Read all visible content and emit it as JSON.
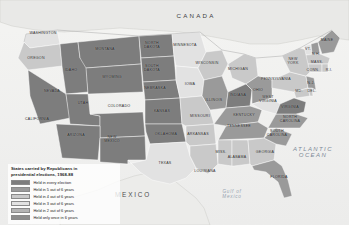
{
  "figure": {
    "width": 349,
    "height": 225,
    "background": "#ffffff"
  },
  "legend": {
    "title": "States carried by Republicans in\npresidential elections, 1968-88",
    "items": [
      {
        "label": "Held in every election",
        "color": "#7d7d7d",
        "count": 6
      },
      {
        "label": "Held in 5 out of 6 years",
        "color": "#9a9a9a",
        "count": 5
      },
      {
        "label": "Held in 4 out of 6 years",
        "color": "#c9c9c9",
        "count": 4
      },
      {
        "label": "Held in 3 out of 6 years",
        "color": "#e2e2e2",
        "count": 3
      },
      {
        "label": "Held in 2 out of 6 years",
        "color": "#b4b4b4",
        "count": 2
      },
      {
        "label": "Held only once in 6 years",
        "color": "#8c8c8c",
        "count": 1
      }
    ]
  },
  "geo_labels": [
    {
      "name": "CANADA",
      "x": 196,
      "y": 16,
      "class": "country-label"
    },
    {
      "name": "MEXICO",
      "x": 133,
      "y": 195,
      "class": "mexico-label"
    },
    {
      "name": "ATLANTIC\nOCEAN",
      "x": 313,
      "y": 152,
      "class": "ocean-label"
    },
    {
      "name": "Gulf of\nMexico",
      "x": 232,
      "y": 195,
      "class": "gulf-label"
    }
  ],
  "states": [
    {
      "name": "WASHINGTON",
      "x": 43,
      "y": 34,
      "tier": 4
    },
    {
      "name": "OREGON",
      "x": 36,
      "y": 59,
      "tier": 4
    },
    {
      "name": "MONTANA",
      "x": 105,
      "y": 50,
      "tier": 6
    },
    {
      "name": "IDAHO",
      "x": 71,
      "y": 71,
      "tier": 6
    },
    {
      "name": "WYOMING",
      "x": 112,
      "y": 78,
      "tier": 6
    },
    {
      "name": "NORTH\nDAKOTA",
      "x": 152,
      "y": 46,
      "tier": 6
    },
    {
      "name": "SOUTH\nDAKOTA",
      "x": 152,
      "y": 69,
      "tier": 6
    },
    {
      "name": "NEBRASKA",
      "x": 155,
      "y": 89,
      "tier": 6
    },
    {
      "name": "NEVADA",
      "x": 52,
      "y": 92,
      "tier": 6
    },
    {
      "name": "UTAH",
      "x": 83,
      "y": 104,
      "tier": 6
    },
    {
      "name": "COLORADO",
      "x": 119,
      "y": 107,
      "tier": 6
    },
    {
      "name": "KANSAS",
      "x": 162,
      "y": 112,
      "tier": 6
    },
    {
      "name": "CALIFORNIA",
      "x": 37,
      "y": 120,
      "tier": 6
    },
    {
      "name": "ARIZONA",
      "x": 76,
      "y": 136,
      "tier": 6
    },
    {
      "name": "NEW\nMEXICO",
      "x": 112,
      "y": 140,
      "tier": 6
    },
    {
      "name": "OKLAHOMA",
      "x": 166,
      "y": 135,
      "tier": 6
    },
    {
      "name": "TEXAS",
      "x": 165,
      "y": 164,
      "tier": 4
    },
    {
      "name": "MINNESOTA",
      "x": 185,
      "y": 46,
      "tier": 3
    },
    {
      "name": "IOWA",
      "x": 190,
      "y": 85,
      "tier": 3
    },
    {
      "name": "MISSOURI",
      "x": 200,
      "y": 117,
      "tier": 4
    },
    {
      "name": "ARKANSAS",
      "x": 198,
      "y": 135,
      "tier": 4
    },
    {
      "name": "LOUISIANA",
      "x": 205,
      "y": 172,
      "tier": 4
    },
    {
      "name": "WISCONSIN",
      "x": 207,
      "y": 64,
      "tier": 4
    },
    {
      "name": "ILLINOIS",
      "x": 214,
      "y": 101,
      "tier": 5
    },
    {
      "name": "MICHIGAN",
      "x": 238,
      "y": 70,
      "tier": 4
    },
    {
      "name": "INDIANA",
      "x": 238,
      "y": 96,
      "tier": 6
    },
    {
      "name": "OHIO",
      "x": 258,
      "y": 91,
      "tier": 5
    },
    {
      "name": "KENTUCKY",
      "x": 244,
      "y": 116,
      "tier": 5
    },
    {
      "name": "TENNESSEE",
      "x": 239,
      "y": 127,
      "tier": 5
    },
    {
      "name": "MISS.",
      "x": 221,
      "y": 153,
      "tier": 4
    },
    {
      "name": "ALABAMA",
      "x": 237,
      "y": 158,
      "tier": 4
    },
    {
      "name": "GEORGIA",
      "x": 265,
      "y": 153,
      "tier": 4
    },
    {
      "name": "FLORIDA",
      "x": 279,
      "y": 178,
      "tier": 5
    },
    {
      "name": "SOUTH\nCAROLINA",
      "x": 277,
      "y": 134,
      "tier": 5
    },
    {
      "name": "NORTH\nCAROLINA",
      "x": 290,
      "y": 120,
      "tier": 5
    },
    {
      "name": "VIRGINIA",
      "x": 290,
      "y": 108,
      "tier": 6
    },
    {
      "name": "WEST\nVIRGINIA",
      "x": 268,
      "y": 100,
      "tier": 3
    },
    {
      "name": "PENNSYLVANIA",
      "x": 276,
      "y": 80,
      "tier": 4
    },
    {
      "name": "NEW\nYORK",
      "x": 293,
      "y": 62,
      "tier": 4
    },
    {
      "name": "MAINE",
      "x": 327,
      "y": 41,
      "tier": 5
    },
    {
      "name": "VT.",
      "x": 308,
      "y": 50,
      "tier": 3
    },
    {
      "name": "N.H.",
      "x": 316,
      "y": 55,
      "tier": 5
    },
    {
      "name": "MASS.",
      "x": 317,
      "y": 63,
      "tier": 4
    },
    {
      "name": "CONN.",
      "x": 313,
      "y": 71,
      "tier": 4
    },
    {
      "name": "R.I.",
      "x": 329,
      "y": 71,
      "tier": 4
    },
    {
      "name": "N.J.",
      "x": 311,
      "y": 84,
      "tier": 5
    },
    {
      "name": "MD.",
      "x": 299,
      "y": 92,
      "tier": 4
    },
    {
      "name": "DEL.",
      "x": 312,
      "y": 92,
      "tier": 4
    }
  ]
}
